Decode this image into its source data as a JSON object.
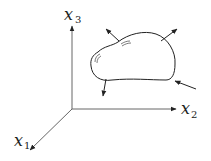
{
  "diagram": {
    "axes": {
      "x1": {
        "label": "x",
        "subscript": "1"
      },
      "x2": {
        "label": "x",
        "subscript": "2"
      },
      "x3": {
        "label": "x",
        "subscript": "3"
      }
    },
    "body": {
      "description": "arbitrary deformable body with surface force vectors"
    },
    "arrows": {
      "count": 4,
      "directions": [
        "outward upper-left",
        "outward upper-right",
        "outward downward",
        "inward from lower-right"
      ]
    },
    "colors": {
      "stroke": "#222222",
      "axis": "#666666",
      "background": "#ffffff"
    }
  }
}
